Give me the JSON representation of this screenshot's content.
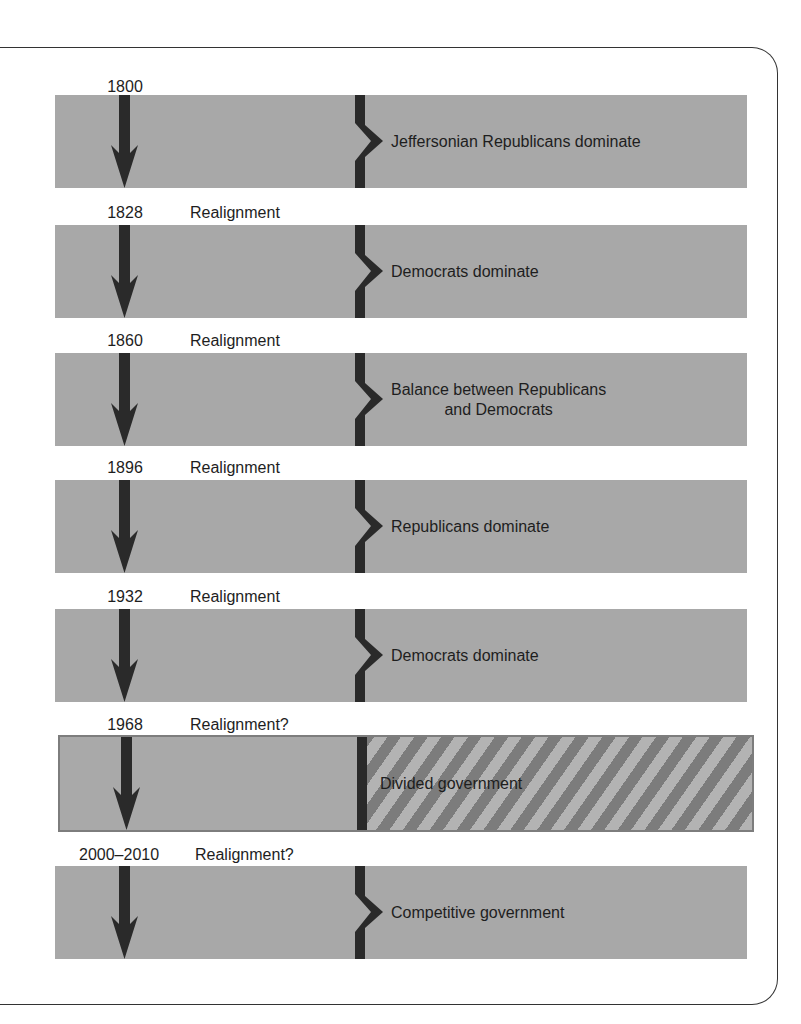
{
  "diagram": {
    "type": "timeline",
    "title": "",
    "colors": {
      "band": "#a8a8a8",
      "arrow": "#2a2a2a",
      "stripe_light": "#b3b3b3",
      "stripe_dark": "#7c7c7c",
      "frame": "#333333"
    },
    "eras": [
      {
        "year": "1800",
        "event": "",
        "description": "Jeffersonian Republicans dominate",
        "style": "solid"
      },
      {
        "year": "1828",
        "event": "Realignment",
        "description": "Democrats dominate",
        "style": "solid"
      },
      {
        "year": "1860",
        "event": "Realignment",
        "description": "Balance between Republicans",
        "description_line2": "and Democrats",
        "style": "solid"
      },
      {
        "year": "1896",
        "event": "Realignment",
        "description": "Republicans dominate",
        "style": "solid"
      },
      {
        "year": "1932",
        "event": "Realignment",
        "description": "Democrats dominate",
        "style": "solid"
      },
      {
        "year": "1968",
        "event": "Realignment?",
        "description": "Divided government",
        "style": "striped"
      },
      {
        "year": "2000–2010",
        "event": "Realignment?",
        "description": "Competitive government",
        "style": "solid"
      }
    ]
  }
}
